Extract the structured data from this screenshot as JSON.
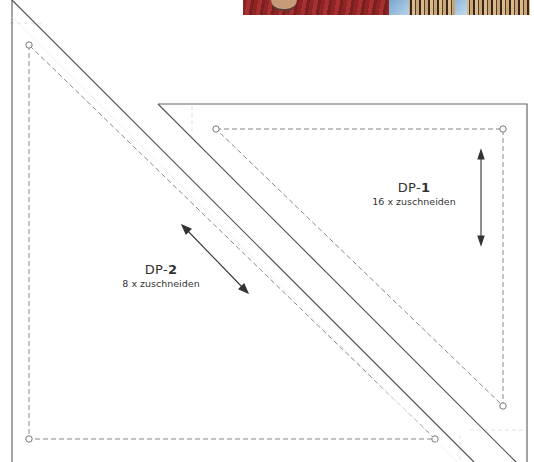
{
  "pieces": [
    {
      "id": "DP-2",
      "prefix": "DP-",
      "number": "2",
      "instruction": "8 x zuschneiden",
      "shape": "right-triangle",
      "grain_arrow": "diagonal"
    },
    {
      "id": "DP-1",
      "prefix": "DP-",
      "number": "1",
      "instruction": "16 x zuschneiden",
      "shape": "right-triangle",
      "grain_arrow": "vertical"
    }
  ],
  "colors": {
    "cut_line": "#555555",
    "seam_line": "#888888",
    "fold_guide": "#dddddd",
    "text": "#333333"
  }
}
